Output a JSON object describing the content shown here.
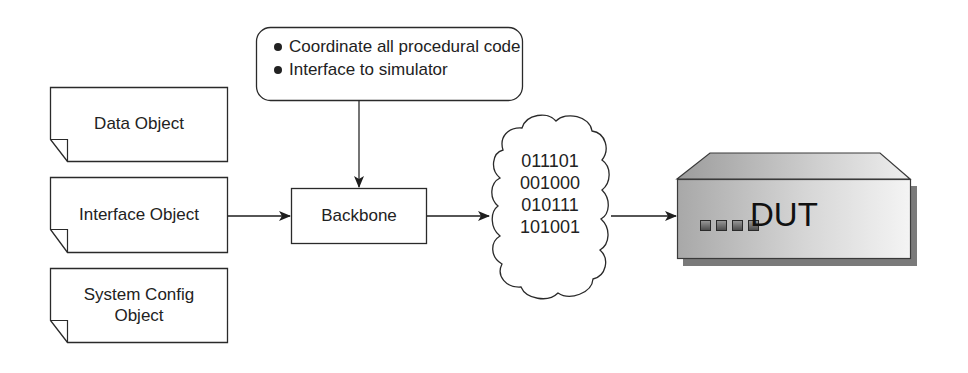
{
  "diagram": {
    "note": {
      "bullets": [
        "Coordinate all procedural code",
        "Interface to simulator"
      ]
    },
    "objects": [
      {
        "label_lines": [
          "Data Object"
        ]
      },
      {
        "label_lines": [
          "Interface Object"
        ]
      },
      {
        "label_lines": [
          "System Config",
          "Object"
        ]
      }
    ],
    "backbone": {
      "label": "Backbone"
    },
    "bitstream": {
      "lines": [
        "011101",
        "001000",
        "010111",
        "101001"
      ]
    },
    "dut": {
      "label": "DUT",
      "indicator_count": 4
    },
    "colors": {
      "stroke": "#2a2a2a",
      "dut_face_light": "#f2f2f2",
      "dut_face_dark": "#a8a8a8",
      "dut_shadow": "#7a7a7a"
    }
  }
}
